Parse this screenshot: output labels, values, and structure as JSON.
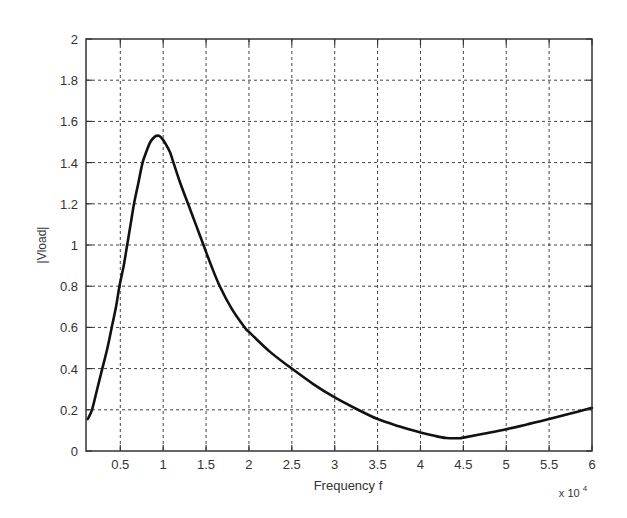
{
  "chart_data": {
    "type": "line",
    "title": "",
    "xlabel": "Frequency f",
    "ylabel": "|Vload|",
    "x_multiplier_label": "x 10",
    "x_multiplier_exponent": "4",
    "xlim": [
      0.1,
      6
    ],
    "ylim": [
      0,
      2
    ],
    "grid": true,
    "legend": null,
    "x_ticks": [
      0.5,
      1,
      1.5,
      2,
      2.5,
      3,
      3.5,
      4,
      4.5,
      5,
      5.5,
      6
    ],
    "x_tick_labels": [
      "0.5",
      "1",
      "1.5",
      "2",
      "2.5",
      "3",
      "3.5",
      "4",
      "4.5",
      "5",
      "5.5",
      "6"
    ],
    "y_ticks": [
      0,
      0.2,
      0.4,
      0.6,
      0.8,
      1,
      1.2,
      1.4,
      1.6,
      1.8,
      2
    ],
    "y_tick_labels": [
      "0",
      "0.2",
      "0.4",
      "0.6",
      "0.8",
      "1",
      "1.2",
      "1.4",
      "1.6",
      "1.8",
      "2"
    ],
    "series": [
      {
        "name": "|Vload|",
        "color": "#111111",
        "x": [
          0.12,
          0.17,
          0.23,
          0.29,
          0.35,
          0.4,
          0.45,
          0.49,
          0.54,
          0.58,
          0.62,
          0.66,
          0.71,
          0.76,
          0.81,
          0.85,
          0.9,
          0.95,
          0.99,
          1.03,
          1.08,
          1.12,
          1.2,
          1.29,
          1.38,
          1.47,
          1.56,
          1.66,
          1.8,
          1.95,
          2.0,
          2.25,
          2.5,
          2.75,
          3.0,
          3.25,
          3.5,
          3.75,
          4.0,
          4.15,
          4.3,
          4.45,
          4.5,
          4.75,
          5.0,
          5.25,
          5.5,
          5.75,
          6.0
        ],
        "y": [
          0.155,
          0.2,
          0.3,
          0.4,
          0.5,
          0.6,
          0.7,
          0.8,
          0.9,
          1.0,
          1.1,
          1.2,
          1.3,
          1.4,
          1.46,
          1.5,
          1.525,
          1.53,
          1.515,
          1.49,
          1.45,
          1.4,
          1.3,
          1.2,
          1.1,
          1.0,
          0.9,
          0.8,
          0.69,
          0.6,
          0.578,
          0.48,
          0.4,
          0.325,
          0.26,
          0.205,
          0.155,
          0.12,
          0.09,
          0.075,
          0.063,
          0.062,
          0.065,
          0.085,
          0.106,
          0.13,
          0.155,
          0.182,
          0.21
        ]
      }
    ]
  },
  "style": {
    "background": "#ffffff",
    "axis_color": "#333333",
    "grid_color": "#444444",
    "line_color": "#111111"
  }
}
